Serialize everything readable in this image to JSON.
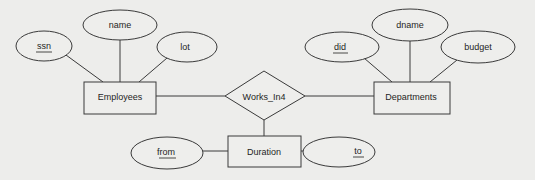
{
  "diagram": {
    "type": "er-diagram",
    "entities": [
      {
        "id": "employees",
        "label": "Employees"
      },
      {
        "id": "departments",
        "label": "Departments"
      },
      {
        "id": "duration",
        "label": "Duration"
      }
    ],
    "relationships": [
      {
        "id": "works_in4",
        "label": "Works_In4",
        "connects": [
          "Employees",
          "Departments",
          "Duration"
        ]
      }
    ],
    "attributes": [
      {
        "id": "ssn",
        "label": "ssn",
        "entity": "Employees",
        "key": true
      },
      {
        "id": "name",
        "label": "name",
        "entity": "Employees",
        "key": false
      },
      {
        "id": "lot",
        "label": "lot",
        "entity": "Employees",
        "key": false
      },
      {
        "id": "did",
        "label": "did",
        "entity": "Departments",
        "key": true
      },
      {
        "id": "dname",
        "label": "dname",
        "entity": "Departments",
        "key": false
      },
      {
        "id": "budget",
        "label": "budget",
        "entity": "Departments",
        "key": false
      },
      {
        "id": "from",
        "label": "from",
        "entity": "Duration",
        "key": true
      },
      {
        "id": "to",
        "label": "to",
        "entity": "Duration",
        "key": true
      }
    ]
  },
  "labels": {
    "ssn": "ssn",
    "name": "name",
    "lot": "lot",
    "employees": "Employees",
    "works_in4": "Works_In4",
    "departments": "Departments",
    "did": "did",
    "dname": "dname",
    "budget": "budget",
    "duration": "Duration",
    "from": "from",
    "to": "to"
  }
}
